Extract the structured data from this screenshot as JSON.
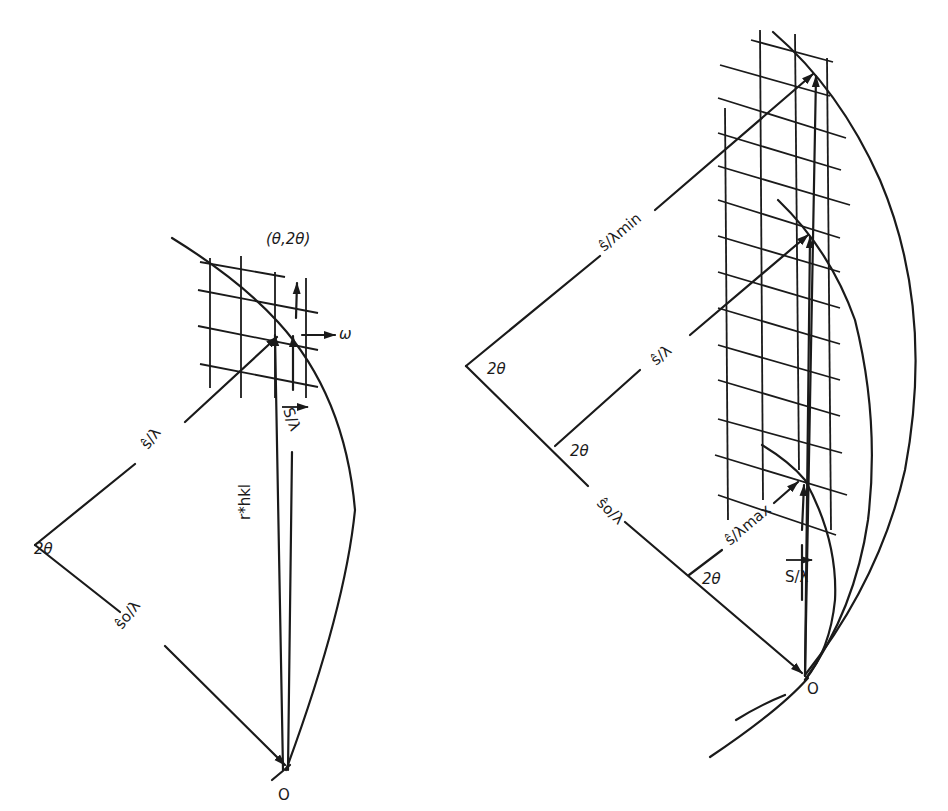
{
  "figure": {
    "left_panel": {
      "angle_label": "2θ",
      "incident_label": "ŝo/λ",
      "diffracted_label": "ŝ/λ",
      "scattering_label": "S/λ",
      "reciprocal_vector_label": "r*hkl",
      "angle_pair_label": "(θ,2θ)",
      "omega_label": "ω",
      "origin_label": "O"
    },
    "right_panel": {
      "angle_label_top": "2θ",
      "angle_label_mid": "2θ",
      "angle_label_low": "2θ",
      "diffracted_min_label": "ŝ/λmin",
      "diffracted_label": "ŝ/λ",
      "diffracted_max_label": "ŝ/λmax",
      "incident_label": "ŝo/λ",
      "scattering_label": "S/λ",
      "origin_label": "O"
    }
  }
}
